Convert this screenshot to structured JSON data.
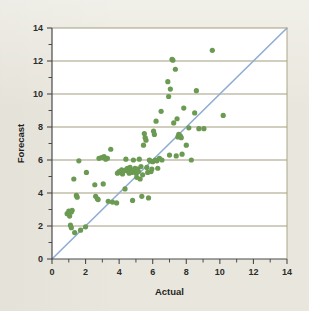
{
  "chart_data": {
    "type": "scatter",
    "title": "",
    "xlabel": "Actual",
    "ylabel": "Forecast",
    "xlim": [
      0,
      14
    ],
    "ylim": [
      0,
      14
    ],
    "xticks": [
      0,
      2,
      4,
      6,
      8,
      10,
      12,
      14
    ],
    "yticks": [
      0,
      2,
      4,
      6,
      8,
      10,
      12,
      14
    ],
    "xticks_minor": [
      1,
      3,
      5,
      7,
      9,
      11,
      13
    ],
    "yticks_minor": [
      1,
      3,
      5,
      7,
      9,
      11,
      13
    ],
    "xticklabels": [
      "0",
      "2",
      "4",
      "6",
      "8",
      "10",
      "12",
      "14"
    ],
    "yticklabels": [
      "0",
      "2",
      "4",
      "6",
      "8",
      "10",
      "12",
      "14"
    ],
    "grid": "horizontal-major",
    "legend": "none",
    "marker_color": "#6b9a52",
    "marker_size": 4.6,
    "grid_color": "#a39d7e",
    "axis_color": "#4a4a4a",
    "plot_background": "#ffffff",
    "figure_background": "#e9e7dd",
    "reference_line": {
      "name": "y = x identity line",
      "color": "#8fadd4",
      "width": 1.6,
      "from": [
        0,
        0
      ],
      "to": [
        14,
        14
      ]
    },
    "series": [
      {
        "name": "Forecast vs Actual",
        "points": [
          [
            0.9,
            2.75
          ],
          [
            1.0,
            2.9
          ],
          [
            1.05,
            2.6
          ],
          [
            1.15,
            2.85
          ],
          [
            1.2,
            2.95
          ],
          [
            1.1,
            2.05
          ],
          [
            1.15,
            1.9
          ],
          [
            1.35,
            1.6
          ],
          [
            1.3,
            4.85
          ],
          [
            1.45,
            3.85
          ],
          [
            1.5,
            3.75
          ],
          [
            1.6,
            5.95
          ],
          [
            1.7,
            1.75
          ],
          [
            2.0,
            1.95
          ],
          [
            2.05,
            5.25
          ],
          [
            2.55,
            4.5
          ],
          [
            2.6,
            3.8
          ],
          [
            2.7,
            3.65
          ],
          [
            2.75,
            3.6
          ],
          [
            2.8,
            6.1
          ],
          [
            2.95,
            6.15
          ],
          [
            3.05,
            4.55
          ],
          [
            3.1,
            6.2
          ],
          [
            3.2,
            6.05
          ],
          [
            3.3,
            6.1
          ],
          [
            3.35,
            3.5
          ],
          [
            3.5,
            6.65
          ],
          [
            3.6,
            3.45
          ],
          [
            3.85,
            3.4
          ],
          [
            3.9,
            5.2
          ],
          [
            4.0,
            5.3
          ],
          [
            4.1,
            5.25
          ],
          [
            4.15,
            5.4
          ],
          [
            4.2,
            5.15
          ],
          [
            4.3,
            5.35
          ],
          [
            4.35,
            4.25
          ],
          [
            4.4,
            6.05
          ],
          [
            4.45,
            5.45
          ],
          [
            4.5,
            5.5
          ],
          [
            4.55,
            5.3
          ],
          [
            4.6,
            5.2
          ],
          [
            4.65,
            5.55
          ],
          [
            4.7,
            5.4
          ],
          [
            4.75,
            5.25
          ],
          [
            4.8,
            3.55
          ],
          [
            4.85,
            6.0
          ],
          [
            4.9,
            5.35
          ],
          [
            4.95,
            5.5
          ],
          [
            5.0,
            5.2
          ],
          [
            5.05,
            4.95
          ],
          [
            5.1,
            5.45
          ],
          [
            5.15,
            5.3
          ],
          [
            5.2,
            6.05
          ],
          [
            5.25,
            4.85
          ],
          [
            5.3,
            5.6
          ],
          [
            5.35,
            3.8
          ],
          [
            5.4,
            5.1
          ],
          [
            5.45,
            6.9
          ],
          [
            5.5,
            7.6
          ],
          [
            5.55,
            7.35
          ],
          [
            5.6,
            7.2
          ],
          [
            5.65,
            5.55
          ],
          [
            5.7,
            5.25
          ],
          [
            5.75,
            3.7
          ],
          [
            5.8,
            6.0
          ],
          [
            5.85,
            5.95
          ],
          [
            5.9,
            5.3
          ],
          [
            5.95,
            5.45
          ],
          [
            6.0,
            5.9
          ],
          [
            6.05,
            7.75
          ],
          [
            6.1,
            7.55
          ],
          [
            6.15,
            6.0
          ],
          [
            6.2,
            8.35
          ],
          [
            6.25,
            5.95
          ],
          [
            6.3,
            5.5
          ],
          [
            6.4,
            6.1
          ],
          [
            6.5,
            8.95
          ],
          [
            6.55,
            6.0
          ],
          [
            6.9,
            10.75
          ],
          [
            6.95,
            9.85
          ],
          [
            7.0,
            6.3
          ],
          [
            7.05,
            10.3
          ],
          [
            7.15,
            12.1
          ],
          [
            7.2,
            12.05
          ],
          [
            7.25,
            8.25
          ],
          [
            7.35,
            11.5
          ],
          [
            7.4,
            6.25
          ],
          [
            7.45,
            8.5
          ],
          [
            7.5,
            7.4
          ],
          [
            7.55,
            7.55
          ],
          [
            7.6,
            7.5
          ],
          [
            7.65,
            7.45
          ],
          [
            7.7,
            7.35
          ],
          [
            7.75,
            6.35
          ],
          [
            7.85,
            9.15
          ],
          [
            8.0,
            6.9
          ],
          [
            8.15,
            7.95
          ],
          [
            8.3,
            6.0
          ],
          [
            8.5,
            8.85
          ],
          [
            8.6,
            10.2
          ],
          [
            8.75,
            7.9
          ],
          [
            9.05,
            7.9
          ],
          [
            9.55,
            12.65
          ],
          [
            10.2,
            8.7
          ]
        ]
      }
    ]
  },
  "axis": {
    "x_title": "Actual",
    "y_title": "Forecast"
  }
}
